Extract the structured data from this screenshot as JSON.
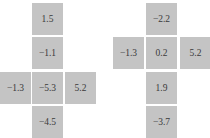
{
  "stencils": [
    {
      "name": "left-stencil",
      "cells": {
        "top2": "1.5",
        "top1": "−1.1",
        "left": "−1.3",
        "center": "−5.3",
        "right": "5.2",
        "bottom1": "−4.5"
      }
    },
    {
      "name": "right-stencil",
      "cells": {
        "top1": "−2.2",
        "left": "−1.3",
        "center": "0.2",
        "right": "5.2",
        "bottom1": "1.9",
        "bottom2": "−3.7"
      }
    }
  ],
  "colors": {
    "cell": "#c4c4c4",
    "text": "#3a3a3a",
    "background": "#ffffff"
  }
}
